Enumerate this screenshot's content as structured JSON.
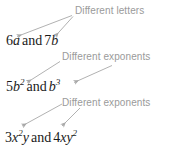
{
  "diagram": {
    "text_color": "#1a1a1a",
    "annotation_color": "#9a9a9a",
    "background": "#ffffff",
    "rows": [
      {
        "label": "Different letters",
        "expression_plain": "6a and 7b",
        "terms": [
          {
            "coefficient": "6",
            "variable": "a",
            "exponent": ""
          },
          {
            "coefficient": "7",
            "variable": "b",
            "exponent": ""
          }
        ],
        "conjunction": "and",
        "arrow_count": 2
      },
      {
        "label": "Different exponents",
        "expression_plain": "5b2 and b3",
        "terms": [
          {
            "coefficient": "5",
            "variable": "b",
            "exponent": "2"
          },
          {
            "coefficient": "",
            "variable": "b",
            "exponent": "3"
          }
        ],
        "conjunction": "and",
        "arrow_count": 2
      },
      {
        "label": "Different exponents",
        "expression_plain": "3x2y and 4xy2",
        "terms": [
          {
            "coefficient": "3",
            "variable": "x",
            "exponent": "2",
            "variable2": "y",
            "exponent2": ""
          },
          {
            "coefficient": "4",
            "variable": "x",
            "exponent": "",
            "variable2": "y",
            "exponent2": "2"
          }
        ],
        "conjunction": "and",
        "arrow_count": 2
      }
    ]
  }
}
